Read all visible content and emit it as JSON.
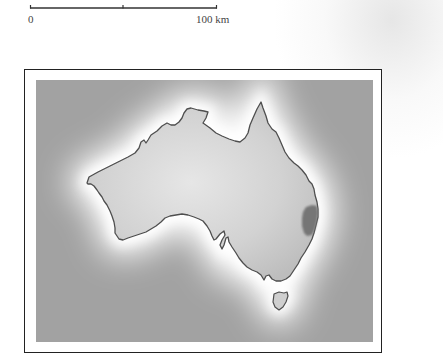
{
  "scale_bar": {
    "start_label": "0",
    "end_label": "100 km",
    "has_midpoint_tick": true
  },
  "map": {
    "subject": "Australia",
    "highlighted_region": "east-coast-region",
    "colors": {
      "ocean": "#a2a2a2",
      "land": "#d4d4d4",
      "coast_glow": "#ffffff",
      "coastline": "#555555",
      "highlight": "#777777",
      "frame": "#222222"
    }
  }
}
